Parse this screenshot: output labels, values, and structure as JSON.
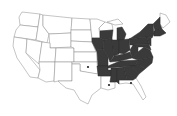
{
  "map": {
    "title": "",
    "region": "Contiguous United States",
    "fill_color": "#3a3a3a",
    "empty_color": "#ffffff",
    "border_color": "#8a8a8a",
    "shaded_states": [
      "IA",
      "MO",
      "AR",
      "IL",
      "WI-south",
      "MI-south",
      "IN",
      "OH",
      "KY",
      "TN",
      "MS",
      "AL",
      "GA",
      "SC",
      "NC",
      "VA",
      "WV",
      "PA",
      "NY",
      "NJ",
      "MD",
      "DE",
      "CT",
      "RI",
      "MA",
      "VT",
      "NH"
    ],
    "unshaded_states": [
      "WA",
      "OR",
      "CA",
      "NV",
      "ID",
      "MT",
      "WY",
      "UT",
      "AZ",
      "CO",
      "NM",
      "ND",
      "SD",
      "NE",
      "KS",
      "OK",
      "TX",
      "MN",
      "LA",
      "FL",
      "ME"
    ],
    "point_records": [
      {
        "state": "OK",
        "x": 88,
        "y": 67
      },
      {
        "state": "LA",
        "x": 109,
        "y": 85
      },
      {
        "state": "FL",
        "x": 131,
        "y": 83
      }
    ]
  }
}
